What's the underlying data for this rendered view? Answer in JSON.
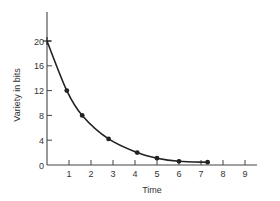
{
  "chart_data": {
    "type": "line",
    "title": "",
    "xlabel": "Time",
    "ylabel": "Variety in bits",
    "x_ticks": [
      1,
      2,
      3,
      4,
      5,
      6,
      7,
      8,
      9
    ],
    "y_ticks": [
      0,
      4,
      8,
      12,
      16,
      20
    ],
    "xlim": [
      0,
      9.5
    ],
    "ylim": [
      0,
      23
    ],
    "grid": false,
    "legend": null,
    "series": [
      {
        "name": "Variety",
        "marker": "dot",
        "points": [
          {
            "x": 0.0,
            "y": 20
          },
          {
            "x": 0.9,
            "y": 12
          },
          {
            "x": 1.6,
            "y": 8
          },
          {
            "x": 2.8,
            "y": 4.2
          },
          {
            "x": 4.1,
            "y": 2
          },
          {
            "x": 5.0,
            "y": 1.1
          },
          {
            "x": 6.0,
            "y": 0.6
          },
          {
            "x": 7.3,
            "y": 0.45
          }
        ],
        "first_point_marker": "plus"
      }
    ],
    "colors": {
      "line": "#222222",
      "axis": "#444444",
      "text": "#333333"
    }
  }
}
